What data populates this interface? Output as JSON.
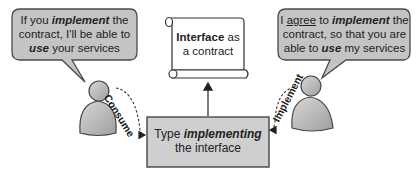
{
  "diagram": {
    "title": "Interface as a contract",
    "colors": {
      "bubble_fill": "#c4c4c4",
      "bubble_stroke": "#4a4a4a",
      "box_fill": "#cfcfcf",
      "box_stroke": "#3a3a3a",
      "person_fill": "#bdbdbd",
      "scroll_fill": "#ffffff",
      "text": "#222222"
    },
    "left_bubble": {
      "line1_pre": "If you ",
      "line1_em": "implement",
      "line1_post": " the",
      "line2": "contract, I'll be able to",
      "line3_em": "use",
      "line3_post": " your services"
    },
    "right_bubble": {
      "line1_pre": "I ",
      "line1_underline": "agree",
      "line1_mid": " to ",
      "line1_em": "implement",
      "line1_post": " the",
      "line2": "contract, so that you are",
      "line3_pre": "able to ",
      "line3_em": "use",
      "line3_post": " my services"
    },
    "scroll": {
      "bold": "Interface",
      "rest_line1": " as",
      "line2": "a contract"
    },
    "box": {
      "line1_pre": "Type ",
      "line1_em": "implementing",
      "line2": "the interface"
    },
    "arrows": {
      "left_label": "Consume",
      "right_label": "Implement"
    },
    "actors": [
      {
        "name": "consumer",
        "side": "left"
      },
      {
        "name": "implementer",
        "side": "right"
      }
    ]
  }
}
